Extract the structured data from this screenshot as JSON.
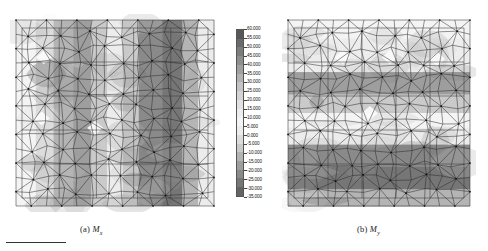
{
  "figure": {
    "panels": [
      {
        "id": "panel-a",
        "caption_prefix": "(a)",
        "caption_symbol": "M",
        "caption_subscript": "x",
        "caption_full": "(a) Mx",
        "description": "finite-element triangular mesh contour plot with vertical grayscale bands"
      },
      {
        "id": "panel-b",
        "caption_prefix": "(b)",
        "caption_symbol": "M",
        "caption_subscript": "y",
        "caption_full": "(b) My",
        "description": "finite-element triangular mesh contour plot with horizontal grayscale bands"
      }
    ]
  },
  "colorbar": {
    "title": "",
    "orientation": "vertical",
    "max": 60.0,
    "min": -35.0,
    "step": 5.0,
    "labels": [
      "60.000",
      "55.000",
      "50.000",
      "45.000",
      "40.000",
      "35.000",
      "30.000",
      "25.000",
      "20.000",
      "15.000",
      "10.000",
      "5.000",
      "0.000",
      "-5.000",
      "-10.000",
      "-15.000",
      "-20.000",
      "-25.000",
      "-30.000",
      "-35.000"
    ],
    "swatches": [
      "#585858",
      "#6a6a6a",
      "#7c7c7c",
      "#8e8e8e",
      "#a0a0a0",
      "#b2b2b2",
      "#c4c4c4",
      "#d4d4d4",
      "#e2e2e2",
      "#ededed",
      "#f4f4f4",
      "#ececec",
      "#dcdcdc",
      "#cacaca",
      "#b4b4b4",
      "#9e9e9e",
      "#8a8a8a",
      "#767676",
      "#636363"
    ]
  },
  "chart_data": {
    "type": "heatmap",
    "title": "",
    "subtitle": "",
    "xlabel": "",
    "ylabel": "",
    "grid": false,
    "legend_position": "center",
    "colorbar_range": [
      -35.0,
      60.0
    ],
    "colorbar_step": 5.0,
    "colorbar_ticks": [
      60,
      55,
      50,
      45,
      40,
      35,
      30,
      25,
      20,
      15,
      10,
      5,
      0,
      -5,
      -10,
      -15,
      -20,
      -25,
      -30,
      -35
    ],
    "panels": [
      {
        "name": "(a) Mx",
        "band_orientation": "vertical",
        "bands": [
          {
            "x_frac": 0.0,
            "width_frac": 0.1,
            "value": 5
          },
          {
            "x_frac": 0.1,
            "width_frac": 0.09,
            "value": -2
          },
          {
            "x_frac": 0.19,
            "width_frac": 0.1,
            "value": -14
          },
          {
            "x_frac": 0.29,
            "width_frac": 0.09,
            "value": -20
          },
          {
            "x_frac": 0.38,
            "width_frac": 0.08,
            "value": -8
          },
          {
            "x_frac": 0.46,
            "width_frac": 0.08,
            "value": 2
          },
          {
            "x_frac": 0.54,
            "width_frac": 0.08,
            "value": -6
          },
          {
            "x_frac": 0.62,
            "width_frac": 0.12,
            "value": -26
          },
          {
            "x_frac": 0.74,
            "width_frac": 0.1,
            "value": -30
          },
          {
            "x_frac": 0.84,
            "width_frac": 0.08,
            "value": -16
          },
          {
            "x_frac": 0.92,
            "width_frac": 0.08,
            "value": 0
          }
        ]
      },
      {
        "name": "(b) My",
        "band_orientation": "horizontal",
        "bands": [
          {
            "y_frac": 0.0,
            "height_frac": 0.1,
            "value": 6
          },
          {
            "y_frac": 0.1,
            "height_frac": 0.1,
            "value": 12
          },
          {
            "y_frac": 0.2,
            "height_frac": 0.08,
            "value": 2
          },
          {
            "y_frac": 0.28,
            "height_frac": 0.12,
            "value": -18
          },
          {
            "y_frac": 0.4,
            "height_frac": 0.1,
            "value": -8
          },
          {
            "y_frac": 0.5,
            "height_frac": 0.08,
            "value": 8
          },
          {
            "y_frac": 0.58,
            "height_frac": 0.09,
            "value": 0
          },
          {
            "y_frac": 0.67,
            "height_frac": 0.12,
            "value": -22
          },
          {
            "y_frac": 0.79,
            "height_frac": 0.12,
            "value": -30
          },
          {
            "y_frac": 0.91,
            "height_frac": 0.09,
            "value": -12
          }
        ]
      }
    ]
  }
}
